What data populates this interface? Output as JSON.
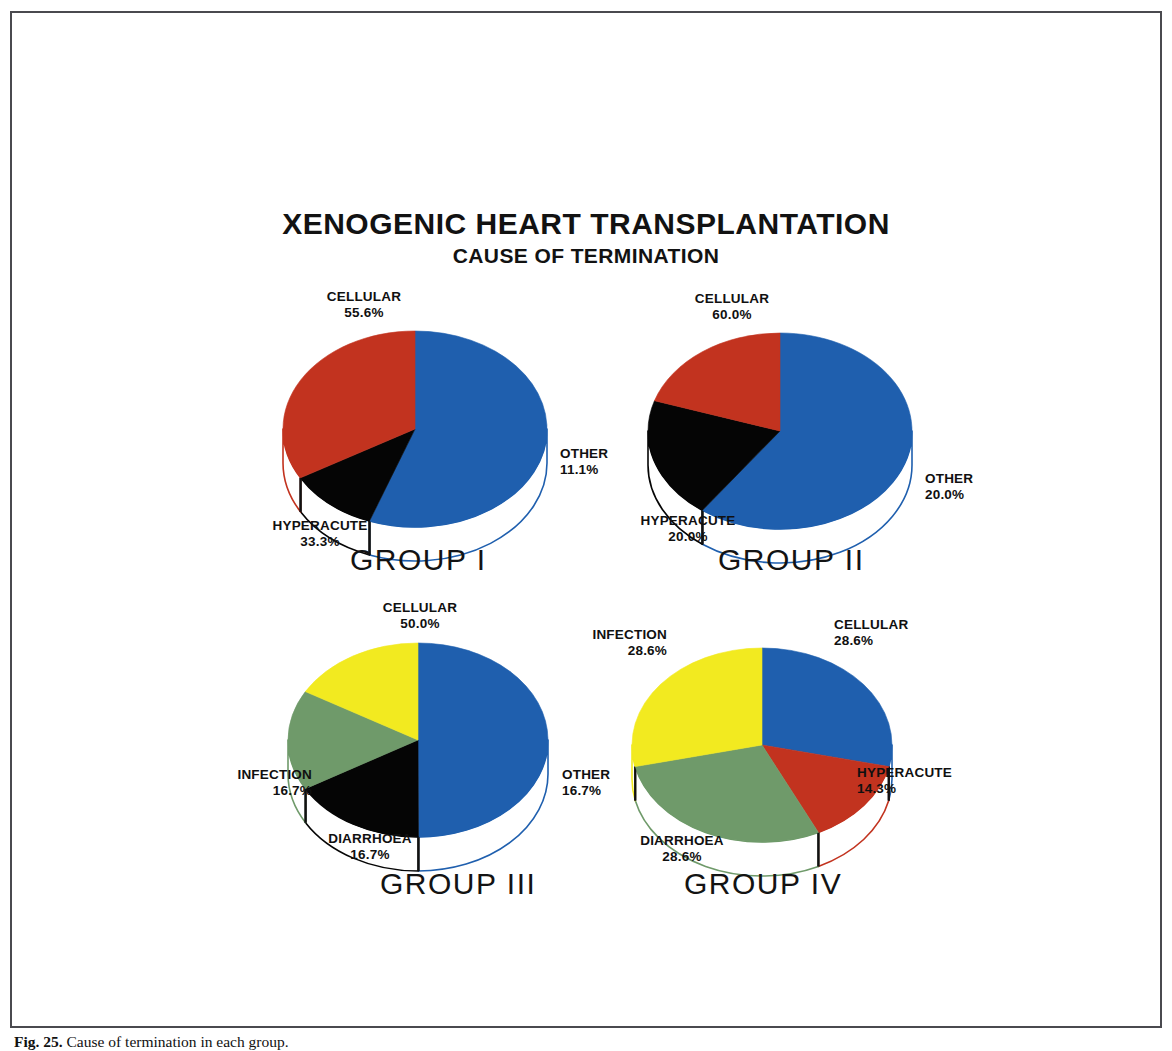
{
  "figure": {
    "title_main": "XENOGENIC HEART TRANSPLANTATION",
    "title_sub": "CAUSE OF TERMINATION",
    "caption_label": "Fig. 25.",
    "caption_text": "Cause of termination in each group.",
    "frame_color": "#4a4a4f",
    "background": "#ffffff"
  },
  "palette": {
    "cellular": "#1f5fae",
    "hyperacute": "#c2331f",
    "other": "#050505",
    "infection": "#f2ea20",
    "diarrhoea": "#6f9a6a",
    "side_wall": "#ffffff",
    "text": "#101010"
  },
  "chart_data": {
    "type": "pie",
    "title": "XENOGENIC HEART TRANSPLANTATION",
    "subtitle": "CAUSE OF TERMINATION",
    "units": "percent",
    "legend": "none",
    "charts": [
      {
        "id": "group-1",
        "caption": "GROUP I",
        "caption_left": 140,
        "caption_top": 262,
        "cx": 205,
        "cy": 148,
        "rx": 132,
        "ry": 98,
        "depth": 34,
        "start_angle": 0,
        "slices": [
          {
            "key": "cellular",
            "label": "CELLULAR",
            "percent": 55.6,
            "value": "55.6%",
            "color": "#1f5fae",
            "label_left": 64,
            "label_top": 8,
            "label_width": 180,
            "align": "lbl-center"
          },
          {
            "key": "other",
            "label": "OTHER",
            "percent": 11.1,
            "value": "11.1%",
            "color": "#050505",
            "label_left": 350,
            "label_top": 165,
            "label_width": 130,
            "align": "lbl-left"
          },
          {
            "key": "hyperacute",
            "label": "HYPERACUTE",
            "percent": 33.3,
            "value": "33.3%",
            "color": "#c2331f",
            "label_left": 20,
            "label_top": 237,
            "label_width": 180,
            "align": "lbl-center"
          }
        ]
      },
      {
        "id": "group-2",
        "caption": "GROUP II",
        "caption_left": 148,
        "caption_top": 262,
        "cx": 210,
        "cy": 150,
        "rx": 132,
        "ry": 98,
        "depth": 34,
        "start_angle": 0,
        "slices": [
          {
            "key": "cellular",
            "label": "CELLULAR",
            "percent": 60.0,
            "value": "60.0%",
            "color": "#1f5fae",
            "label_left": 72,
            "label_top": 10,
            "label_width": 180,
            "align": "lbl-center"
          },
          {
            "key": "other",
            "label": "OTHER",
            "percent": 20.0,
            "value": "20.0%",
            "color": "#050505",
            "label_left": 355,
            "label_top": 190,
            "label_width": 130,
            "align": "lbl-left"
          },
          {
            "key": "hyperacute",
            "label": "HYPERACUTE",
            "percent": 20.0,
            "value": "20.0%",
            "color": "#c2331f",
            "label_left": 28,
            "label_top": 232,
            "label_width": 180,
            "align": "lbl-center"
          }
        ]
      },
      {
        "id": "group-3",
        "caption": "GROUP III",
        "caption_left": 190,
        "caption_top": 262,
        "cx": 228,
        "cy": 135,
        "rx": 130,
        "ry": 97,
        "depth": 34,
        "start_angle": 0,
        "slices": [
          {
            "key": "cellular",
            "label": "CELLULAR",
            "percent": 50.0,
            "value": "50.0%",
            "color": "#1f5fae",
            "label_left": 140,
            "label_top": -5,
            "label_width": 180,
            "align": "lbl-center"
          },
          {
            "key": "other",
            "label": "OTHER",
            "percent": 16.7,
            "value": "16.7%",
            "color": "#050505",
            "label_left": 372,
            "label_top": 162,
            "label_width": 130,
            "align": "lbl-left"
          },
          {
            "key": "diarrhoea",
            "label": "DIARRHOEA",
            "percent": 16.7,
            "value": "16.7%",
            "color": "#6f9a6a",
            "label_left": 90,
            "label_top": 226,
            "label_width": 180,
            "align": "lbl-center"
          },
          {
            "key": "infection",
            "label": "INFECTION",
            "percent": 16.7,
            "value": "16.7%",
            "color": "#f2ea20",
            "label_left": -8,
            "label_top": 162,
            "label_width": 130,
            "align": "lbl-right"
          }
        ]
      },
      {
        "id": "group-4",
        "caption": "GROUP IV",
        "caption_left": 112,
        "caption_top": 262,
        "cx": 190,
        "cy": 140,
        "rx": 130,
        "ry": 97,
        "depth": 34,
        "start_angle": 0,
        "slices": [
          {
            "key": "cellular",
            "label": "CELLULAR",
            "percent": 28.6,
            "value": "28.6%",
            "color": "#1f5fae",
            "label_left": 262,
            "label_top": 12,
            "label_width": 150,
            "align": "lbl-left"
          },
          {
            "key": "hyperacute",
            "label": "HYPERACUTE",
            "percent": 14.3,
            "value": "14.3%",
            "color": "#c2331f",
            "label_left": 285,
            "label_top": 160,
            "label_width": 150,
            "align": "lbl-left"
          },
          {
            "key": "diarrhoea",
            "label": "DIARRHOEA",
            "percent": 28.6,
            "value": "28.6%",
            "color": "#6f9a6a",
            "label_left": 20,
            "label_top": 228,
            "label_width": 180,
            "align": "lbl-center"
          },
          {
            "key": "infection",
            "label": "INFECTION",
            "percent": 28.6,
            "value": "28.6%",
            "color": "#f2ea20",
            "label_left": -55,
            "label_top": 22,
            "label_width": 150,
            "align": "lbl-right"
          }
        ]
      }
    ]
  }
}
